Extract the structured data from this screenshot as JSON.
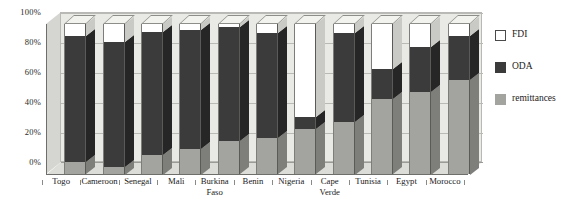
{
  "chart_data": {
    "type": "bar",
    "subtype": "100% stacked column (3-D)",
    "title": "",
    "xlabel": "",
    "ylabel": "",
    "ylim": [
      0,
      100
    ],
    "ytick_labels": [
      "0%",
      "20%",
      "40%",
      "60%",
      "80%",
      "100%"
    ],
    "ytick_values": [
      0,
      20,
      40,
      60,
      80,
      100
    ],
    "grid": true,
    "legend_position": "right",
    "stack_order_bottom_to_top": [
      "remittances",
      "ODA",
      "FDI"
    ],
    "categories": [
      "Togo",
      "Cameroon",
      "Senegal",
      "Mali",
      "Burkina Faso",
      "Benin",
      "Nigeria",
      "Cape Verde",
      "Tunisia",
      "Egypt",
      "Morocco"
    ],
    "series": [
      {
        "name": "remittances",
        "color": "#a3a39f",
        "values": [
          8,
          5,
          13,
          17,
          22,
          24,
          30,
          35,
          50,
          55,
          63
        ]
      },
      {
        "name": "ODA",
        "color": "#3b3b3b",
        "values": [
          84,
          83,
          82,
          79,
          76,
          70,
          8,
          59,
          20,
          30,
          29
        ]
      },
      {
        "name": "FDI",
        "color": "#ffffff",
        "values": [
          8,
          12,
          5,
          4,
          2,
          6,
          62,
          6,
          30,
          15,
          8
        ]
      }
    ]
  },
  "legend": {
    "items": [
      {
        "label": "FDI",
        "swatch": "white-swatch-icon"
      },
      {
        "label": "ODA",
        "swatch": "dark-swatch-icon"
      },
      {
        "label": "remittances",
        "swatch": "gray-swatch-icon"
      }
    ]
  }
}
